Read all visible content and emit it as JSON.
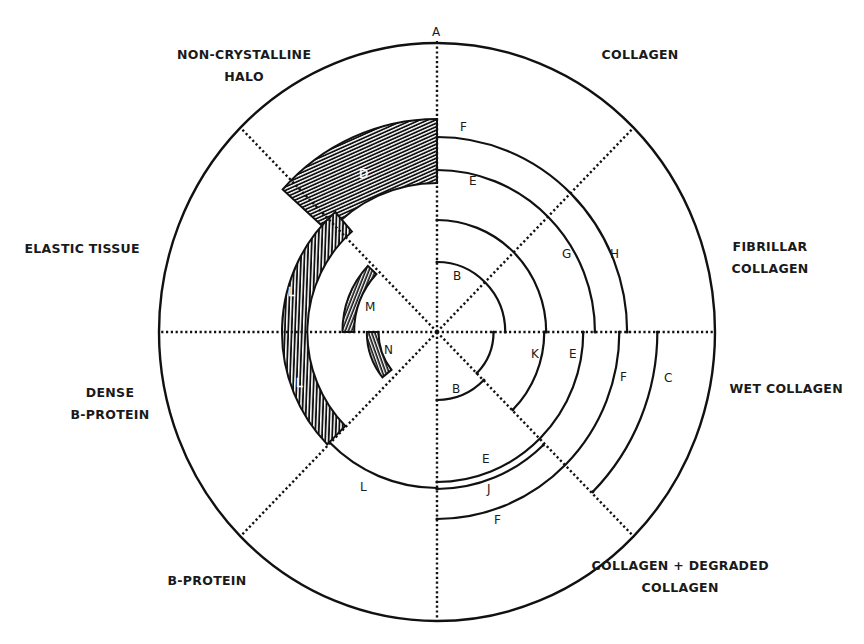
{
  "diagram": {
    "title": "",
    "center": {
      "x": 437,
      "y": 332
    },
    "outer": {
      "rx": 278,
      "ry": 289
    },
    "x_scale": 0.975,
    "colors": {
      "line": "#111111",
      "hatch": "#111111",
      "background": "#ffffff"
    },
    "axis_label": "A",
    "sectors": [
      {
        "id": "collagen",
        "lines": [
          "COLLAGEN"
        ],
        "x": 640,
        "y": 44
      },
      {
        "id": "fibrillar-collagen",
        "lines": [
          "FIBRILLAR",
          "COLLAGEN"
        ],
        "x": 770,
        "y": 236
      },
      {
        "id": "wet-collagen",
        "lines": [
          "WET COLLAGEN"
        ],
        "x": 786,
        "y": 378
      },
      {
        "id": "collagen-degraded",
        "lines": [
          "COLLAGEN + DEGRADED",
          "COLLAGEN"
        ],
        "x": 680,
        "y": 555
      },
      {
        "id": "b-protein",
        "lines": [
          "B-PROTEIN"
        ],
        "x": 207,
        "y": 570
      },
      {
        "id": "dense-b-protein",
        "lines": [
          "DENSE",
          "B-PROTEIN"
        ],
        "x": 110,
        "y": 382
      },
      {
        "id": "elastic-tissue",
        "lines": [
          "ELASTIC TISSUE"
        ],
        "x": 82,
        "y": 238
      },
      {
        "id": "non-crystalline-halo",
        "lines": [
          "NON-CRYSTALLINE",
          "HALO"
        ],
        "x": 244,
        "y": 44
      }
    ],
    "arcs": [
      {
        "r": 70,
        "start": 0,
        "end": 90,
        "label": "B",
        "lx": 453,
        "ly": 280
      },
      {
        "r": 112,
        "start": 0,
        "end": 90
      },
      {
        "r": 162,
        "start": 0,
        "end": 90,
        "label": "E",
        "lx": 469,
        "ly": 185
      },
      {
        "r": 195,
        "start": 0,
        "end": 90,
        "label": "F",
        "lx": 460,
        "ly": 131
      },
      {
        "r": 58,
        "start": -45,
        "end": 0
      },
      {
        "r": 68,
        "start": -90,
        "end": -45,
        "label": "B",
        "lx": 452,
        "ly": 393
      },
      {
        "r": 110,
        "start": -45,
        "end": 0,
        "label": "K",
        "lx": 531,
        "ly": 358
      },
      {
        "r": 150,
        "start": -90,
        "end": 0
      },
      {
        "r": 157,
        "start": -90,
        "end": -46
      },
      {
        "r": 187,
        "start": -90,
        "end": 0
      },
      {
        "r": 226,
        "start": -45,
        "end": 0,
        "label": "C",
        "lx": 664,
        "ly": 382
      },
      {
        "r": 156,
        "start": -135,
        "end": -90,
        "label": "L",
        "lx": 360,
        "ly": 491
      }
    ],
    "arc_labels": [
      {
        "text": "G",
        "x": 562,
        "y": 258
      },
      {
        "text": "H",
        "x": 610,
        "y": 258
      },
      {
        "text": "E",
        "x": 569,
        "y": 358
      },
      {
        "text": "F",
        "x": 620,
        "y": 381
      },
      {
        "text": "E",
        "x": 482,
        "y": 463
      },
      {
        "text": "J",
        "x": 487,
        "y": 493
      },
      {
        "text": "F",
        "x": 494,
        "y": 524
      },
      {
        "text": "M",
        "x": 365,
        "y": 311
      },
      {
        "text": "N",
        "x": 384,
        "y": 354
      }
    ],
    "hatched_bands": [
      {
        "id": "D",
        "r_in": 149,
        "r_out": 213,
        "start": 90,
        "end": 138,
        "label": "D",
        "lx": 359,
        "ly": 178,
        "spacing": 3.2
      },
      {
        "id": "L",
        "r_in": 133,
        "r_out": 159,
        "start": 131,
        "end": 225,
        "label": "L",
        "lx": 288,
        "ly": 296,
        "label2": "L",
        "lx2": 296,
        "ly2": 387,
        "spacing": 3.4
      },
      {
        "id": "M",
        "r_in": 85,
        "r_out": 97,
        "start": 137,
        "end": 180,
        "spacing": 3
      },
      {
        "id": "N",
        "r_in": 60,
        "r_out": 72,
        "start": 180,
        "end": 219,
        "spacing": 3
      }
    ]
  }
}
